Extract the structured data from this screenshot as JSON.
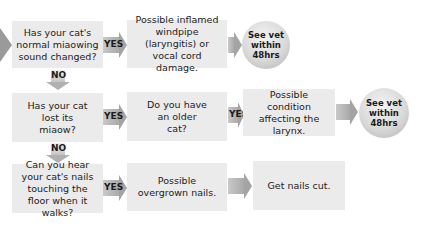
{
  "flowchart": {
    "rows": [
      {
        "question": "Has your cat's normal miaowing sound changed?",
        "yes_label": "YES",
        "result": "Possible inflamed windpipe (laryngitis) or vocal cord damage.",
        "action": "See vet within 48hrs"
      },
      {
        "question": "Has your cat lost its miaow?",
        "yes_label": "YES",
        "followup": "Do you have an older cat?",
        "followup_yes_label": "YES",
        "result": "Possible condition affecting the larynx.",
        "action": "See vet within 48hrs"
      },
      {
        "question": "Can you hear your cat's nails touching the floor when it walks?",
        "yes_label": "YES",
        "result": "Possible overgrown nails.",
        "action": "Get nails cut."
      }
    ],
    "no_labels": [
      "NO",
      "NO"
    ]
  },
  "colors": {
    "box": "#ebebeb",
    "arrow": "#a9a9a9",
    "circle": "#d9d9d9"
  }
}
